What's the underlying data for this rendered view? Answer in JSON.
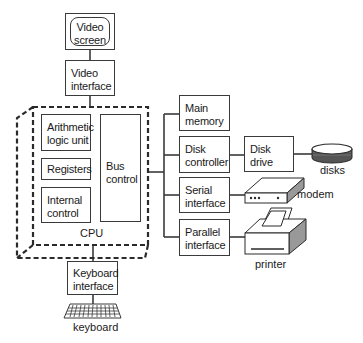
{
  "diagram": {
    "nodes": {
      "video_screen": {
        "lines": [
          "Video",
          "screen"
        ]
      },
      "video_interface": {
        "lines": [
          "Video",
          "interface"
        ]
      },
      "alu": {
        "lines": [
          "Arithmetic",
          "logic unit"
        ]
      },
      "registers": {
        "lines": [
          "Registers"
        ]
      },
      "internal_control": {
        "lines": [
          "Internal",
          "control"
        ]
      },
      "bus_control": {
        "lines": [
          "Bus",
          "control"
        ]
      },
      "cpu": {
        "label": "CPU"
      },
      "keyboard_interface": {
        "lines": [
          "Keyboard",
          "interface"
        ]
      },
      "main_memory": {
        "lines": [
          "Main",
          "memory"
        ]
      },
      "disk_controller": {
        "lines": [
          "Disk",
          "controller"
        ]
      },
      "serial_interface": {
        "lines": [
          "Serial",
          "interface"
        ]
      },
      "parallel_interface": {
        "lines": [
          "Parallel",
          "interface"
        ]
      },
      "disk_drive": {
        "lines": [
          "Disk",
          "drive"
        ]
      }
    },
    "devices": {
      "keyboard": {
        "label": "keyboard",
        "icon": "keyboard-icon"
      },
      "disks": {
        "label": "disks",
        "icon": "disk-stack-icon"
      },
      "modem": {
        "label": "modem",
        "icon": "modem-icon"
      },
      "printer": {
        "label": "printer",
        "icon": "printer-icon"
      }
    },
    "edges": [
      [
        "video_screen",
        "video_interface"
      ],
      [
        "video_interface",
        "cpu"
      ],
      [
        "cpu",
        "keyboard_interface"
      ],
      [
        "keyboard_interface",
        "keyboard"
      ],
      [
        "bus_control",
        "main_memory"
      ],
      [
        "bus_control",
        "disk_controller"
      ],
      [
        "bus_control",
        "serial_interface"
      ],
      [
        "bus_control",
        "parallel_interface"
      ],
      [
        "disk_controller",
        "disk_drive"
      ],
      [
        "disk_drive",
        "disks"
      ],
      [
        "serial_interface",
        "modem"
      ],
      [
        "parallel_interface",
        "printer"
      ]
    ],
    "colors": {
      "stroke": "#3a3a3a",
      "shade": "#9a9a9a",
      "background": "#ffffff"
    }
  }
}
